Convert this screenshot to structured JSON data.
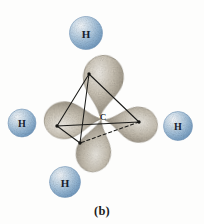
{
  "figure": {
    "caption": "(b)",
    "background_color": "#fdfdfc",
    "central_atom": {
      "symbol": "C",
      "name": "carbon",
      "x": 103,
      "y": 117,
      "label_color": "#20211d"
    },
    "hydrogen_atoms": [
      {
        "symbol": "H",
        "position": "top",
        "cx": 86,
        "cy": 33,
        "r": 16.5,
        "fill_color": "#a8c4dd",
        "label_color": "#16202c",
        "font_size": 11
      },
      {
        "symbol": "H",
        "position": "left",
        "cx": 22,
        "cy": 123,
        "r": 14.0,
        "fill_color": "#a8c4dd",
        "label_color": "#16202c",
        "font_size": 10
      },
      {
        "symbol": "H",
        "position": "right",
        "cx": 178,
        "cy": 126,
        "r": 14.5,
        "fill_color": "#a8c4dd",
        "label_color": "#16202c",
        "font_size": 10
      },
      {
        "symbol": "H",
        "position": "bottom",
        "cx": 65,
        "cy": 182,
        "r": 15.5,
        "fill_color": "#a8c4dd",
        "label_color": "#16202c",
        "font_size": 11
      }
    ],
    "orbital_lobes": [
      {
        "name": "sp3-lobe-top",
        "direction": "up",
        "tip_x": 100,
        "tip_y": 116,
        "end_x": 92,
        "end_y": 58,
        "width": 40,
        "fill_color": "#b9b2a4"
      },
      {
        "name": "sp3-lobe-left",
        "direction": "left",
        "tip_x": 101,
        "tip_y": 119,
        "end_x": 46,
        "end_y": 122,
        "width": 38,
        "fill_color": "#b9b2a4"
      },
      {
        "name": "sp3-lobe-right",
        "direction": "right",
        "tip_x": 105,
        "tip_y": 120,
        "end_x": 150,
        "end_y": 128,
        "width": 36,
        "fill_color": "#c2bbae"
      },
      {
        "name": "sp3-lobe-bottom",
        "direction": "down-front",
        "tip_x": 101,
        "tip_y": 120,
        "end_x": 88,
        "end_y": 165,
        "width": 36,
        "fill_color": "#b9b2a4"
      }
    ],
    "tetrahedron": {
      "stroke_color": "#1a1a18",
      "vertices": [
        {
          "name": "vertex-top",
          "x": 89,
          "y": 74
        },
        {
          "name": "vertex-left",
          "x": 57,
          "y": 126
        },
        {
          "name": "vertex-right",
          "x": 139,
          "y": 122
        },
        {
          "name": "vertex-front",
          "x": 80,
          "y": 143
        }
      ],
      "solid_edges": [
        [
          "vertex-top",
          "vertex-left"
        ],
        [
          "vertex-top",
          "vertex-right"
        ],
        [
          "vertex-left",
          "vertex-right"
        ],
        [
          "vertex-top",
          "vertex-front"
        ],
        [
          "vertex-left",
          "vertex-front"
        ]
      ],
      "dashed_edges": [
        [
          "vertex-right",
          "vertex-front"
        ]
      ]
    }
  }
}
